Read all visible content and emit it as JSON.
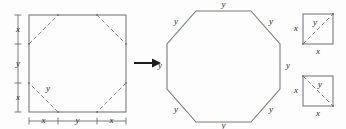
{
  "figure": {
    "background_color": "#fdfdfd",
    "line_color": "#7a7a7a",
    "dash_color": "#8a8a8a",
    "label_color": "#2b2b2b",
    "arrow_color": "#1d1d1d"
  },
  "square_panel": {
    "name": "square-with-corner-cuts",
    "shape": "square",
    "corner_cuts": "dashed",
    "left_ruler": {
      "segments": [
        {
          "label": "x"
        },
        {
          "label": "y"
        },
        {
          "label": "x"
        }
      ]
    },
    "bottom_ruler": {
      "segments": [
        {
          "label": "x"
        },
        {
          "label": "y"
        },
        {
          "label": "x"
        }
      ]
    },
    "inner_label": "y"
  },
  "arrow": {
    "name": "transformation-arrow",
    "direction": "right"
  },
  "octagon_panel": {
    "name": "regular-octagon",
    "shape": "octagon",
    "side_labels": [
      "y",
      "y",
      "y",
      "y",
      "y",
      "y",
      "y",
      "y"
    ]
  },
  "corner_squares": [
    {
      "name": "corner-square-top",
      "diagonal_direction": "bottom-left-to-top-right",
      "left_label": "x",
      "bottom_label": "x",
      "diagonal_label": "y"
    },
    {
      "name": "corner-square-bottom",
      "diagonal_direction": "top-left-to-bottom-right",
      "left_label": "x",
      "bottom_label": "x",
      "diagonal_label": "y"
    }
  ]
}
